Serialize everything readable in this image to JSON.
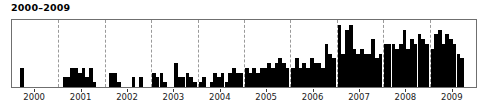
{
  "chart": {
    "title": "2000–2009",
    "background_color": "#ffffff",
    "bar_color": "#000000",
    "frame_color": "#6f6f6f",
    "gridline_color": "#9a9a9a",
    "axis_text_color": "#1a1a1a"
  },
  "chart_data": {
    "type": "bar",
    "title": "2000–2009",
    "xlabel": "",
    "ylabel": "",
    "grid": true,
    "grid_axis": "x",
    "legend": "none",
    "xlim": [
      2000.0,
      2010.0
    ],
    "ylim": [
      0,
      14
    ],
    "tick_labels": [
      "2000",
      "2001",
      "2002",
      "2003",
      "2004",
      "2005",
      "2006",
      "2007",
      "2008",
      "2009"
    ],
    "tick_positions": [
      2000.5,
      2001.5,
      2002.5,
      2003.5,
      2004.5,
      2005.5,
      2006.5,
      2007.5,
      2008.5,
      2009.5
    ],
    "gridline_positions": [
      2001,
      2002,
      2003,
      2004,
      2005,
      2006,
      2007,
      2008,
      2009
    ],
    "x": [
      2000.02,
      2000.1,
      2000.18,
      2000.26,
      2000.34,
      2000.42,
      2000.5,
      2000.58,
      2000.66,
      2000.74,
      2000.82,
      2000.9,
      2001.02,
      2001.1,
      2001.18,
      2001.26,
      2001.34,
      2001.42,
      2001.5,
      2001.58,
      2001.66,
      2001.74,
      2001.82,
      2001.9,
      2002.02,
      2002.1,
      2002.18,
      2002.26,
      2002.34,
      2002.42,
      2002.5,
      2002.58,
      2002.66,
      2002.74,
      2002.82,
      2002.9,
      2003.02,
      2003.1,
      2003.18,
      2003.26,
      2003.34,
      2003.42,
      2003.5,
      2003.58,
      2003.66,
      2003.74,
      2003.82,
      2003.9,
      2004.02,
      2004.1,
      2004.18,
      2004.26,
      2004.34,
      2004.42,
      2004.5,
      2004.58,
      2004.66,
      2004.74,
      2004.82,
      2004.9,
      2005.02,
      2005.1,
      2005.18,
      2005.26,
      2005.34,
      2005.42,
      2005.5,
      2005.58,
      2005.66,
      2005.74,
      2005.82,
      2005.9,
      2006.02,
      2006.1,
      2006.18,
      2006.26,
      2006.34,
      2006.42,
      2006.5,
      2006.58,
      2006.66,
      2006.74,
      2006.82,
      2006.9,
      2007.02,
      2007.1,
      2007.18,
      2007.26,
      2007.34,
      2007.42,
      2007.5,
      2007.58,
      2007.66,
      2007.74,
      2007.82,
      2007.9,
      2008.02,
      2008.1,
      2008.18,
      2008.26,
      2008.34,
      2008.42,
      2008.5,
      2008.58,
      2008.66,
      2008.74,
      2008.82,
      2008.9,
      2009.02,
      2009.1,
      2009.18,
      2009.26,
      2009.34,
      2009.42,
      2009.5,
      2009.58,
      2009.66,
      2009.74,
      2009.82,
      2009.9
    ],
    "values": [
      0,
      0,
      4,
      0,
      0,
      0,
      0,
      0,
      0,
      0,
      0,
      0,
      0,
      2,
      2,
      4,
      4,
      3,
      4,
      2,
      4,
      1,
      0,
      0,
      0,
      3,
      3,
      1,
      0,
      0,
      0,
      2,
      0,
      2,
      0,
      0,
      3,
      2,
      3,
      1,
      0,
      0,
      5,
      2,
      2,
      3,
      2,
      1,
      1,
      2,
      0,
      1,
      3,
      2,
      3,
      1,
      3,
      4,
      3,
      3,
      4,
      3,
      4,
      3,
      4,
      4,
      5,
      4,
      5,
      6,
      5,
      4,
      4,
      6,
      4,
      5,
      4,
      6,
      5,
      5,
      4,
      9,
      7,
      6,
      13,
      7,
      12,
      13,
      8,
      7,
      8,
      7,
      7,
      10,
      6,
      7,
      9,
      9,
      9,
      8,
      9,
      12,
      8,
      10,
      9,
      11,
      10,
      9,
      8,
      11,
      12,
      9,
      11,
      10,
      9,
      7,
      6,
      0,
      0,
      0
    ]
  }
}
